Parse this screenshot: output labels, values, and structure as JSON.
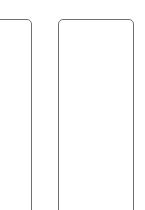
{
  "diagram": {
    "stroke_color": "#6e6e6e",
    "background": "#ffffff",
    "boxes": [
      {
        "name": "left-panel",
        "x": -10,
        "y": 19,
        "width": 42,
        "height": 200,
        "label": ""
      },
      {
        "name": "right-panel",
        "x": 58,
        "y": 19,
        "width": 76,
        "height": 200,
        "label": ""
      }
    ]
  }
}
